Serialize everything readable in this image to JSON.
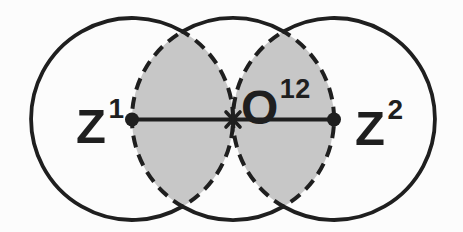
{
  "diagram": {
    "labels": {
      "left": {
        "base": "Z",
        "sup": "1"
      },
      "center": {
        "base": "O",
        "sup": "12"
      },
      "right": {
        "base": "Z",
        "sup": "2"
      }
    },
    "colors": {
      "stroke": "#1f1f1f",
      "lens_fill": "#c7c7c7",
      "background": "#fcfcfc"
    }
  }
}
